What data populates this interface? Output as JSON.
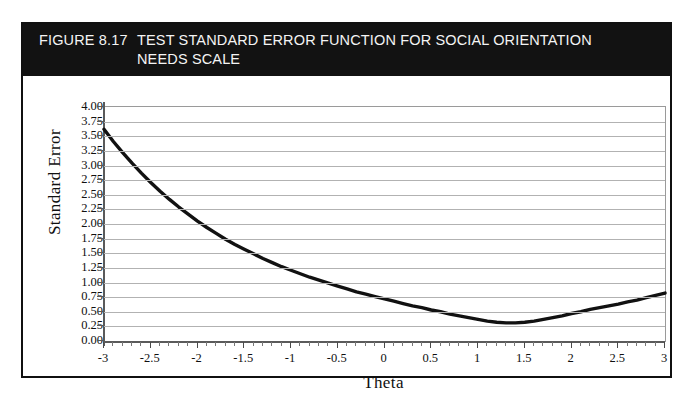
{
  "figure": {
    "number": "FIGURE 8.17",
    "title": "TEST STANDARD ERROR FUNCTION FOR SOCIAL ORIENTATION NEEDS SCALE",
    "banner_color": "#121212",
    "banner_text_color": "#f4f4f4",
    "frame_color": "#101010",
    "background": "#ffffff"
  },
  "chart_data": {
    "type": "line",
    "title": "TEST STANDARD ERROR FUNCTION FOR SOCIAL ORIENTATION NEEDS SCALE",
    "xlabel": "Theta",
    "ylabel": "Standard Error",
    "xlim": [
      -3,
      3
    ],
    "ylim": [
      0.0,
      4.0
    ],
    "grid": true,
    "legend": "none",
    "line_color": "#111111",
    "line_width": 3.4,
    "xticks": [
      -3,
      -2.5,
      -2,
      -1.5,
      -1,
      -0.5,
      0,
      0.5,
      1,
      1.5,
      2,
      2.5,
      3
    ],
    "xtick_labels": [
      "-3",
      "-2.5",
      "-2",
      "-1.5",
      "-1",
      "-0.5",
      "0",
      "0.5",
      "1",
      "1.5",
      "2",
      "2.5",
      "3"
    ],
    "xtick_minor_step": 0.1,
    "yticks": [
      0.0,
      0.25,
      0.5,
      0.75,
      1.0,
      1.25,
      1.5,
      1.75,
      2.0,
      2.25,
      2.5,
      2.75,
      3.0,
      3.25,
      3.5,
      3.75,
      4.0
    ],
    "ytick_labels": [
      "0.00",
      "0.25",
      "0.50",
      "0.75",
      "1.00",
      "1.25",
      "1.50",
      "1.75",
      "2.00",
      "2.25",
      "2.50",
      "2.75",
      "3.00",
      "3.25",
      "3.50",
      "3.75",
      "4.00"
    ],
    "series": [
      {
        "name": "Standard Error",
        "x": [
          -3.0,
          -2.9,
          -2.8,
          -2.7,
          -2.6,
          -2.5,
          -2.4,
          -2.3,
          -2.2,
          -2.1,
          -2.0,
          -1.9,
          -1.8,
          -1.7,
          -1.6,
          -1.5,
          -1.4,
          -1.3,
          -1.2,
          -1.1,
          -1.0,
          -0.9,
          -0.8,
          -0.7,
          -0.6,
          -0.5,
          -0.4,
          -0.3,
          -0.2,
          -0.1,
          0.0,
          0.1,
          0.2,
          0.3,
          0.4,
          0.5,
          0.6,
          0.7,
          0.8,
          0.9,
          1.0,
          1.1,
          1.2,
          1.3,
          1.4,
          1.5,
          1.6,
          1.7,
          1.8,
          1.9,
          2.0,
          2.1,
          2.2,
          2.3,
          2.4,
          2.5,
          2.6,
          2.7,
          2.8,
          2.9,
          3.0
        ],
        "y": [
          3.62,
          3.41,
          3.22,
          3.04,
          2.87,
          2.71,
          2.56,
          2.42,
          2.29,
          2.17,
          2.05,
          1.94,
          1.84,
          1.74,
          1.65,
          1.57,
          1.49,
          1.41,
          1.34,
          1.27,
          1.21,
          1.15,
          1.09,
          1.04,
          0.99,
          0.94,
          0.89,
          0.84,
          0.8,
          0.76,
          0.72,
          0.68,
          0.64,
          0.6,
          0.57,
          0.53,
          0.5,
          0.46,
          0.43,
          0.4,
          0.37,
          0.34,
          0.32,
          0.31,
          0.31,
          0.32,
          0.34,
          0.37,
          0.4,
          0.43,
          0.47,
          0.5,
          0.54,
          0.57,
          0.6,
          0.63,
          0.67,
          0.7,
          0.74,
          0.78,
          0.82
        ]
      }
    ],
    "notes": {
      "minimum_theta": 1.25,
      "minimum_value": 0.3,
      "max_value_at_left": 3.62,
      "value_at_right": 0.82
    }
  }
}
